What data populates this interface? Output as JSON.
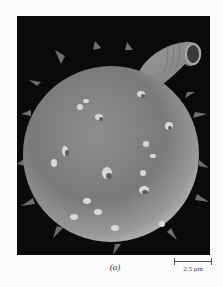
{
  "figure": {
    "caption": "(a)",
    "scale_bar_label": "2.5 μm"
  },
  "colors": {
    "page_background": "#fbfbfb",
    "photo_background": "#0a0a0a",
    "specimen": "#8a8a8a",
    "text": "#333333"
  }
}
